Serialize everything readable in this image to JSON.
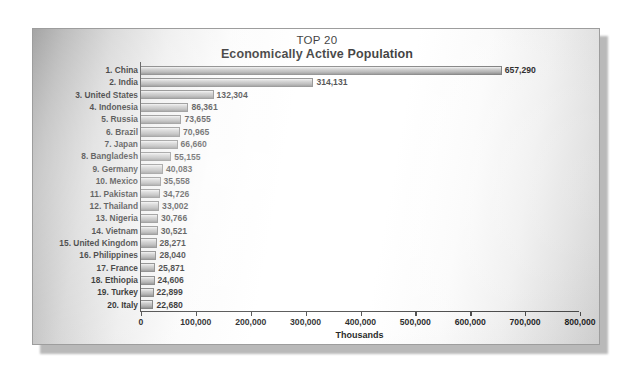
{
  "figure": {
    "title_main": "TOP 20",
    "title_sub": "Economically Active Population",
    "x_axis_title": "Thousands"
  },
  "chart_data": {
    "type": "bar",
    "orientation": "horizontal",
    "title": "TOP 20 Economically Active Population",
    "subtitle": "Economically Active Population",
    "xlabel": "Thousands",
    "ylabel": "",
    "xlim": [
      0,
      800000
    ],
    "xticks": [
      0,
      100000,
      200000,
      300000,
      400000,
      500000,
      600000,
      700000,
      800000
    ],
    "xtick_labels": [
      "0",
      "100,000",
      "200,000",
      "300,000",
      "400,000",
      "500,000",
      "600,000",
      "700,000",
      "800,000"
    ],
    "grid": false,
    "legend": false,
    "categories": [
      "1. China",
      "2. India",
      "3. United States",
      "4. Indonesia",
      "5. Russia",
      "6. Brazil",
      "7. Japan",
      "8. Bangladesh",
      "9. Germany",
      "10. Mexico",
      "11. Pakistan",
      "12. Thailand",
      "13. Nigeria",
      "14. Vietnam",
      "15. United Kingdom",
      "16. Philippines",
      "17. France",
      "18. Ethiopia",
      "19. Turkey",
      "20. Italy"
    ],
    "values": [
      657290,
      314131,
      132304,
      86361,
      73655,
      70965,
      66660,
      55155,
      40083,
      35558,
      34726,
      33002,
      30766,
      30521,
      28271,
      28040,
      25871,
      24606,
      22899,
      22680
    ],
    "value_labels": [
      "657,290",
      "314,131",
      "132,304",
      "86,361",
      "73,655",
      "70,965",
      "66,660",
      "55,155",
      "40,083",
      "35,558",
      "34,726",
      "33,002",
      "30,766",
      "30,521",
      "28,271",
      "28,040",
      "25,871",
      "24,606",
      "22,899",
      "22,680"
    ]
  },
  "colors": {
    "bar_light": "#f2f2f2",
    "bar_dark": "#7c7c7c",
    "bar_border": "#6e6e6e",
    "axis": "#3a3a3a",
    "text": "#0d0d0d",
    "card_bg": "#ffffff",
    "page_bg": "#ffffff"
  }
}
